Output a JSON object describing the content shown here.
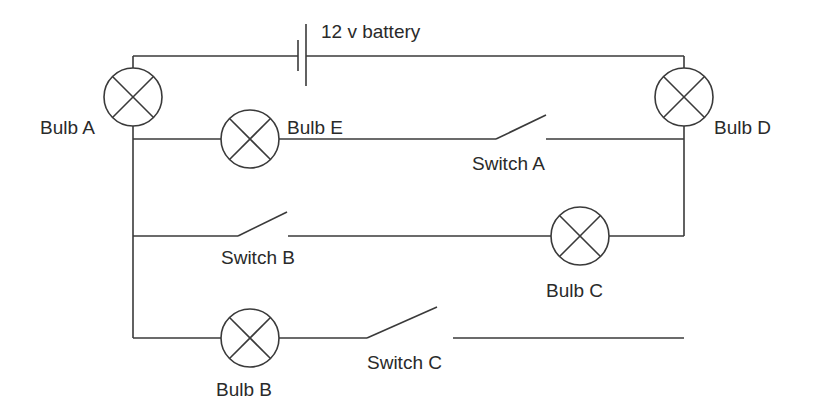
{
  "diagram": {
    "type": "circuit",
    "battery": {
      "label": "12 v battery"
    },
    "bulbs": [
      {
        "id": "A",
        "label": "Bulb A"
      },
      {
        "id": "B",
        "label": "Bulb B"
      },
      {
        "id": "C",
        "label": "Bulb C"
      },
      {
        "id": "D",
        "label": "Bulb D"
      },
      {
        "id": "E",
        "label": "Bulb E"
      }
    ],
    "switches": [
      {
        "id": "A",
        "label": "Switch A",
        "state": "open"
      },
      {
        "id": "B",
        "label": "Switch B",
        "state": "open"
      },
      {
        "id": "C",
        "label": "Switch C",
        "state": "open"
      }
    ],
    "colors": {
      "line": "#3a3a3a",
      "text": "#2a2a2a",
      "background": "#ffffff"
    }
  }
}
